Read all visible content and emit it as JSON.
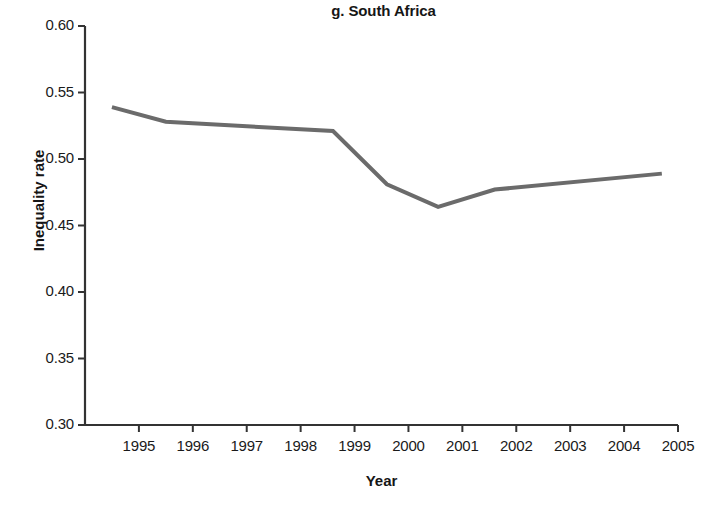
{
  "chart_data": {
    "type": "line",
    "title": "g. South Africa",
    "xlabel": "Year",
    "ylabel": "Inequality rate",
    "xlim": [
      1994,
      2005
    ],
    "ylim": [
      0.3,
      0.6
    ],
    "grid": false,
    "legend": null,
    "line_color": "#6b6b6b",
    "axis_color": "#333333",
    "x_ticks": [
      "1995",
      "1996",
      "1997",
      "1998",
      "1999",
      "2000",
      "2001",
      "2002",
      "2003",
      "2004",
      "2005"
    ],
    "y_ticks": [
      "0.60",
      "0.55",
      "0.50",
      "0.45",
      "0.40",
      "0.35",
      "0.30"
    ],
    "series": [
      {
        "name": "Inequality rate",
        "x": [
          1994.5,
          1995.5,
          1998.6,
          1999.6,
          2000.55,
          2001.6,
          2004.7
        ],
        "values": [
          0.539,
          0.528,
          0.521,
          0.481,
          0.464,
          0.477,
          0.489
        ]
      }
    ]
  }
}
